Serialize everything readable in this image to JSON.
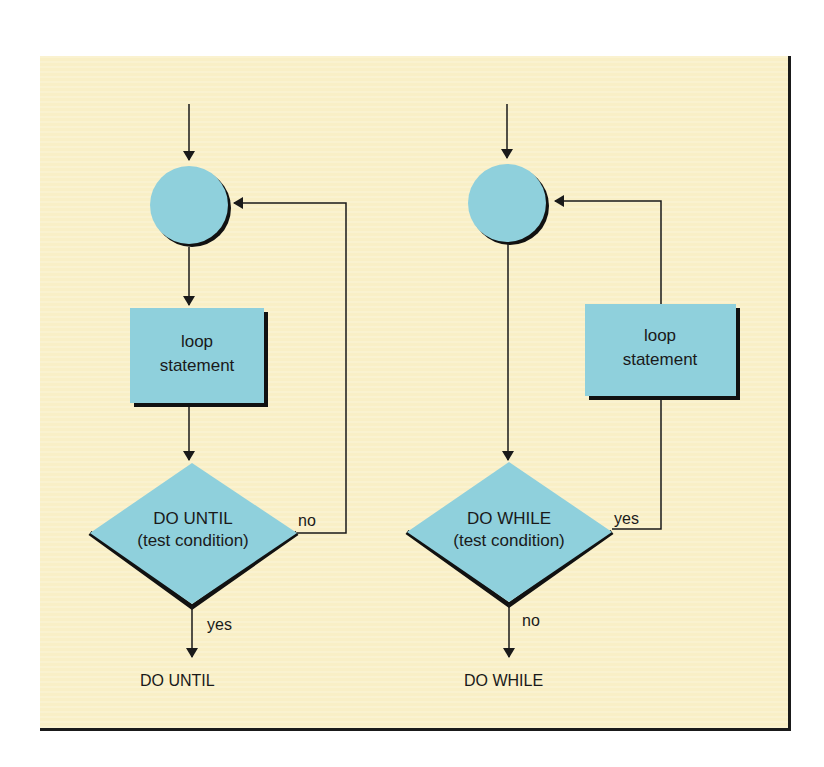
{
  "diagram": {
    "colors": {
      "background": "#f9efc6",
      "shape_fill": "#8fd0dc",
      "shadow": "#111111",
      "line": "#1a1a1a"
    },
    "left": {
      "loop_box": {
        "line1": "loop",
        "line2": "statement"
      },
      "decision": {
        "line1": "DO UNTIL",
        "line2": "(test condition)"
      },
      "branch_back_label": "no",
      "branch_exit_label": "yes",
      "exit_label": "DO UNTIL"
    },
    "right": {
      "loop_box": {
        "line1": "loop",
        "line2": "statement"
      },
      "decision": {
        "line1": "DO WHILE",
        "line2": "(test condition)"
      },
      "branch_back_label": "yes",
      "branch_exit_label": "no",
      "exit_label": "DO WHILE"
    }
  }
}
